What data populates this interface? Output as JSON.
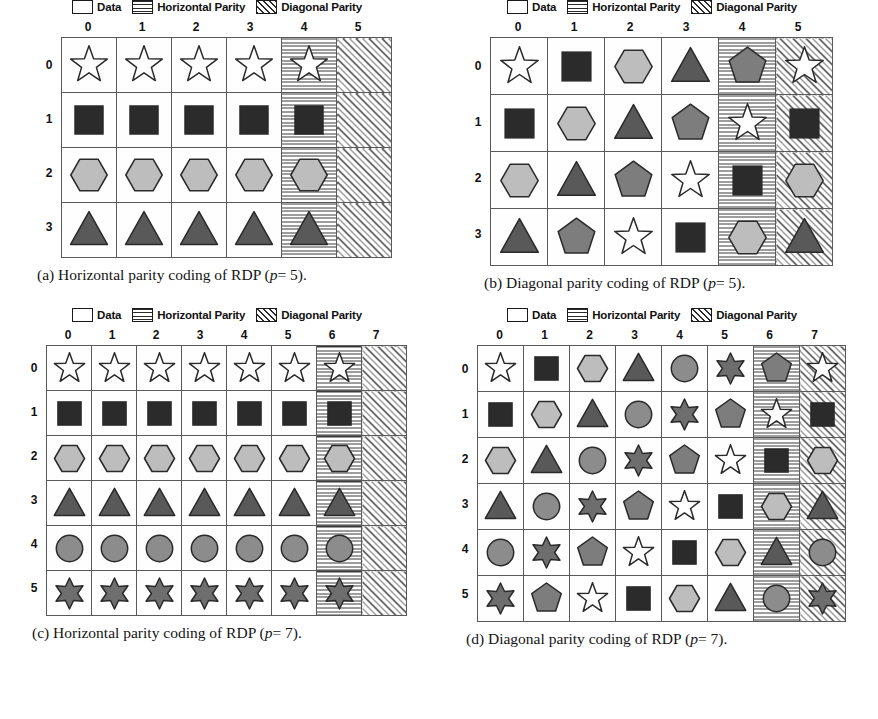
{
  "legend": {
    "items": [
      {
        "label": "Data",
        "swatch": "white-square-icon"
      },
      {
        "label": "Horizontal Parity",
        "swatch": "horizontal-hatch-square-icon"
      },
      {
        "label": "Diagonal Parity",
        "swatch": "diagonal-hatch-square-icon"
      }
    ]
  },
  "shape_colors": {
    "star": "#ffffff",
    "square": "#2b2b2b",
    "hexagon": "#bdbdbd",
    "triangle": "#595959",
    "circle": "#8c8c8c",
    "sixstar": "#6e6e6e",
    "pentagon": "#7d7d7d",
    "outline": "#2a2a2a"
  },
  "subfigures": [
    {
      "id": "a",
      "caption_label": "(a)",
      "caption_text": "Horizontal parity coding of RDP (",
      "caption_var": "p",
      "caption_eq": "= 5).",
      "p": 5,
      "rows": 4,
      "cols": 6,
      "col_labels": [
        "0",
        "1",
        "2",
        "3",
        "4",
        "5"
      ],
      "row_labels": [
        "0",
        "1",
        "2",
        "3"
      ],
      "col_types": [
        "data",
        "data",
        "data",
        "data",
        "hp",
        "dp"
      ],
      "cells": [
        [
          "star",
          "star",
          "star",
          "star",
          "star",
          ""
        ],
        [
          "square",
          "square",
          "square",
          "square",
          "square",
          ""
        ],
        [
          "hexagon",
          "hexagon",
          "hexagon",
          "hexagon",
          "hexagon",
          ""
        ],
        [
          "triangle",
          "triangle",
          "triangle",
          "triangle",
          "triangle",
          ""
        ]
      ]
    },
    {
      "id": "b",
      "caption_label": "(b)",
      "caption_text": "Diagonal parity coding of RDP (",
      "caption_var": "p",
      "caption_eq": "= 5).",
      "p": 5,
      "rows": 4,
      "cols": 6,
      "col_labels": [
        "0",
        "1",
        "2",
        "3",
        "4",
        "5"
      ],
      "row_labels": [
        "0",
        "1",
        "2",
        "3"
      ],
      "col_types": [
        "data",
        "data",
        "data",
        "data",
        "hp",
        "dp"
      ],
      "cells": [
        [
          "star",
          "square",
          "hexagon",
          "triangle",
          "pentagon",
          "star"
        ],
        [
          "square",
          "hexagon",
          "triangle",
          "pentagon",
          "star",
          "square"
        ],
        [
          "hexagon",
          "triangle",
          "pentagon",
          "star",
          "square",
          "hexagon"
        ],
        [
          "triangle",
          "pentagon",
          "star",
          "square",
          "hexagon",
          "triangle"
        ]
      ]
    },
    {
      "id": "c",
      "caption_label": "(c)",
      "caption_text": "Horizontal parity coding of RDP (",
      "caption_var": "p",
      "caption_eq": "= 7).",
      "p": 7,
      "rows": 6,
      "cols": 8,
      "col_labels": [
        "0",
        "1",
        "2",
        "3",
        "4",
        "5",
        "6",
        "7"
      ],
      "row_labels": [
        "0",
        "1",
        "2",
        "3",
        "4",
        "5"
      ],
      "col_types": [
        "data",
        "data",
        "data",
        "data",
        "data",
        "data",
        "hp",
        "dp"
      ],
      "cells": [
        [
          "star",
          "star",
          "star",
          "star",
          "star",
          "star",
          "star",
          ""
        ],
        [
          "square",
          "square",
          "square",
          "square",
          "square",
          "square",
          "square",
          ""
        ],
        [
          "hexagon",
          "hexagon",
          "hexagon",
          "hexagon",
          "hexagon",
          "hexagon",
          "hexagon",
          ""
        ],
        [
          "triangle",
          "triangle",
          "triangle",
          "triangle",
          "triangle",
          "triangle",
          "triangle",
          ""
        ],
        [
          "circle",
          "circle",
          "circle",
          "circle",
          "circle",
          "circle",
          "circle",
          ""
        ],
        [
          "sixstar",
          "sixstar",
          "sixstar",
          "sixstar",
          "sixstar",
          "sixstar",
          "sixstar",
          ""
        ]
      ]
    },
    {
      "id": "d",
      "caption_label": "(d)",
      "caption_text": "Diagonal parity coding of RDP (",
      "caption_var": "p",
      "caption_eq": "= 7).",
      "p": 7,
      "rows": 6,
      "cols": 8,
      "col_labels": [
        "0",
        "1",
        "2",
        "3",
        "4",
        "5",
        "6",
        "7"
      ],
      "row_labels": [
        "0",
        "1",
        "2",
        "3",
        "4",
        "5"
      ],
      "col_types": [
        "data",
        "data",
        "data",
        "data",
        "data",
        "data",
        "hp",
        "dp"
      ],
      "cells": [
        [
          "star",
          "square",
          "hexagon",
          "triangle",
          "circle",
          "sixstar",
          "pentagon",
          "star"
        ],
        [
          "square",
          "hexagon",
          "triangle",
          "circle",
          "sixstar",
          "pentagon",
          "star",
          "square"
        ],
        [
          "hexagon",
          "triangle",
          "circle",
          "sixstar",
          "pentagon",
          "star",
          "square",
          "hexagon"
        ],
        [
          "triangle",
          "circle",
          "sixstar",
          "pentagon",
          "star",
          "square",
          "hexagon",
          "triangle"
        ],
        [
          "circle",
          "sixstar",
          "pentagon",
          "star",
          "square",
          "hexagon",
          "triangle",
          "circle"
        ],
        [
          "sixstar",
          "pentagon",
          "star",
          "square",
          "hexagon",
          "triangle",
          "circle",
          "sixstar"
        ]
      ]
    }
  ]
}
